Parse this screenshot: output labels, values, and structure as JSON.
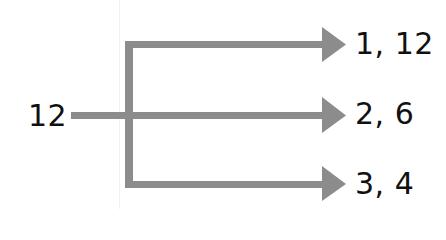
{
  "diagram": {
    "type": "factor-pairs-tree",
    "root": {
      "label": "12"
    },
    "branches": [
      {
        "label": "1, 12"
      },
      {
        "label": "2, 6"
      },
      {
        "label": "3, 4"
      }
    ],
    "colors": {
      "line": "#8c8c8c",
      "text": "#111111"
    }
  }
}
